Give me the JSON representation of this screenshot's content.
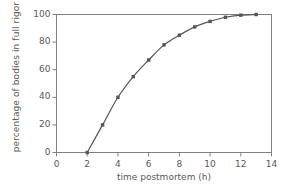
{
  "chart_data": {
    "type": "line",
    "title": "",
    "xlabel": "time postmortem (h)",
    "ylabel": "percentage of bodies in full rigor",
    "xlim": [
      0,
      14
    ],
    "ylim": [
      0,
      100
    ],
    "xticks": [
      0,
      2,
      4,
      6,
      8,
      10,
      12,
      14
    ],
    "yticks": [
      0,
      20,
      40,
      60,
      80,
      100
    ],
    "grid": false,
    "legend": "none",
    "marker": "square",
    "line_color": "#555555",
    "marker_color": "#555555",
    "axis_color": "#808080",
    "text_color": "#5a5a5a",
    "x": [
      2,
      3,
      4,
      5,
      6,
      7,
      8,
      9,
      10,
      11,
      12,
      13
    ],
    "values": [
      0,
      20,
      40,
      55,
      67,
      78,
      85,
      91,
      95,
      98,
      99.5,
      100
    ],
    "series": [
      {
        "name": "percentage of bodies in full rigor",
        "x": [
          2,
          3,
          4,
          5,
          6,
          7,
          8,
          9,
          10,
          11,
          12,
          13
        ],
        "values": [
          0,
          20,
          40,
          55,
          67,
          78,
          85,
          91,
          95,
          98,
          99.5,
          100
        ]
      }
    ]
  },
  "axes": {
    "y_tick_labels": [
      "0",
      "20",
      "40",
      "60",
      "80",
      "100"
    ],
    "x_tick_labels": [
      "0",
      "2",
      "4",
      "6",
      "8",
      "10",
      "12",
      "14"
    ],
    "x_title": "time postmortem (h)",
    "y_title": "percentage of bodies in full rigor"
  }
}
